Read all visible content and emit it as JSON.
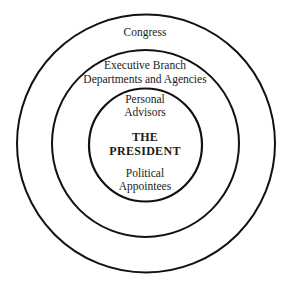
{
  "diagram": {
    "type": "concentric-circles",
    "rings": [
      {
        "level": "outer",
        "label": "Congress"
      },
      {
        "level": "middle",
        "label_line1": "Executive Branch",
        "label_line2": "Departments and Agencies"
      },
      {
        "level": "inner",
        "top_line1": "Personal",
        "top_line2": "Advisors",
        "bottom_line1": "Political",
        "bottom_line2": "Appointees"
      }
    ],
    "center": {
      "line1": "THE",
      "line2": "PRESIDENT"
    },
    "stroke_color": "#111111",
    "background": "#ffffff"
  }
}
